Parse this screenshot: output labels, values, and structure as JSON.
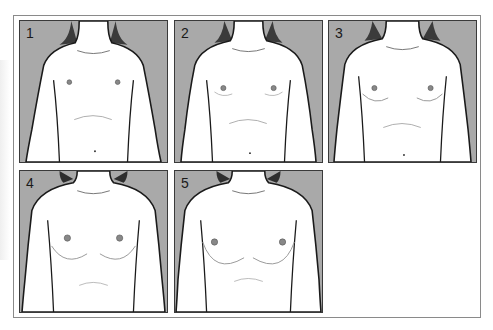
{
  "figure": {
    "panels": [
      {
        "label": "1",
        "stage": 1
      },
      {
        "label": "2",
        "stage": 2
      },
      {
        "label": "3",
        "stage": 3
      },
      {
        "label": "4",
        "stage": 4
      },
      {
        "label": "5",
        "stage": 5
      }
    ]
  },
  "colors": {
    "panel_background": "#a9a9a9",
    "figure_fill": "#ffffff",
    "outline": "#1a1a1a",
    "hair": "#3b3b3b"
  }
}
